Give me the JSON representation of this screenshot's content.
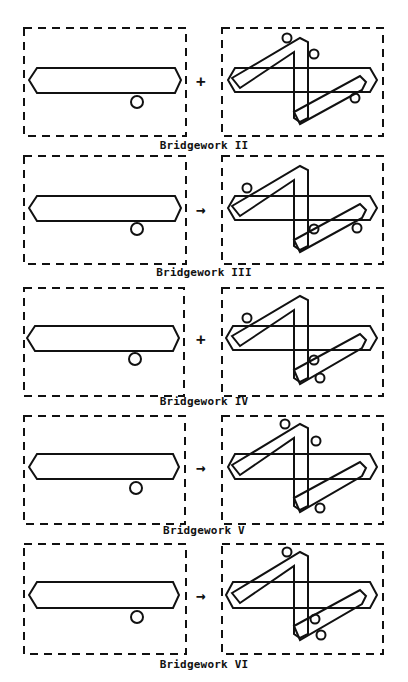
{
  "figure": {
    "stroke_color": "#111111",
    "background": "#ffffff",
    "rows": [
      {
        "caption": "Bridgework II",
        "arrow": "+",
        "left_circle": "bottom",
        "right_variant": "II"
      },
      {
        "caption": "Bridgework III",
        "arrow": "→",
        "left_circle": "bottom",
        "right_variant": "III"
      },
      {
        "caption": "Bridgework IV",
        "arrow": "+",
        "left_circle": "bottom",
        "right_variant": "IV"
      },
      {
        "caption": "Bridgework V",
        "arrow": "→",
        "left_circle": "bottom",
        "right_variant": "V"
      },
      {
        "caption": "Bridgework VI",
        "arrow": "→",
        "left_circle": "bottom",
        "right_variant": "VI"
      }
    ]
  }
}
